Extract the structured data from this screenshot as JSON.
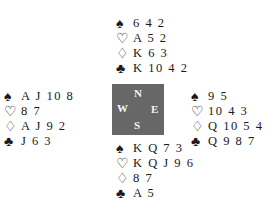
{
  "deal": {
    "north": {
      "spades": "6 4 2",
      "hearts": "A 5 2",
      "diamonds": "K 6 3",
      "clubs": "K 10 4 2"
    },
    "west": {
      "spades": "A J 10 8",
      "hearts": "8 7",
      "diamonds": "A J 9 2",
      "clubs": "J 6 3"
    },
    "east": {
      "spades": "9 5",
      "hearts": "10 4 3",
      "diamonds": "Q 10 5 4",
      "clubs": "Q 9 8 7"
    },
    "south": {
      "spades": "K Q 7 3",
      "hearts": "K Q J 9 6",
      "diamonds": "8 7",
      "clubs": "A 5"
    }
  },
  "symbols": {
    "spades": "♠",
    "hearts": "♡",
    "diamonds": "♢",
    "clubs": "♣"
  },
  "compass": {
    "n": "N",
    "w": "W",
    "e": "E",
    "s": "S",
    "color": "#676767"
  }
}
